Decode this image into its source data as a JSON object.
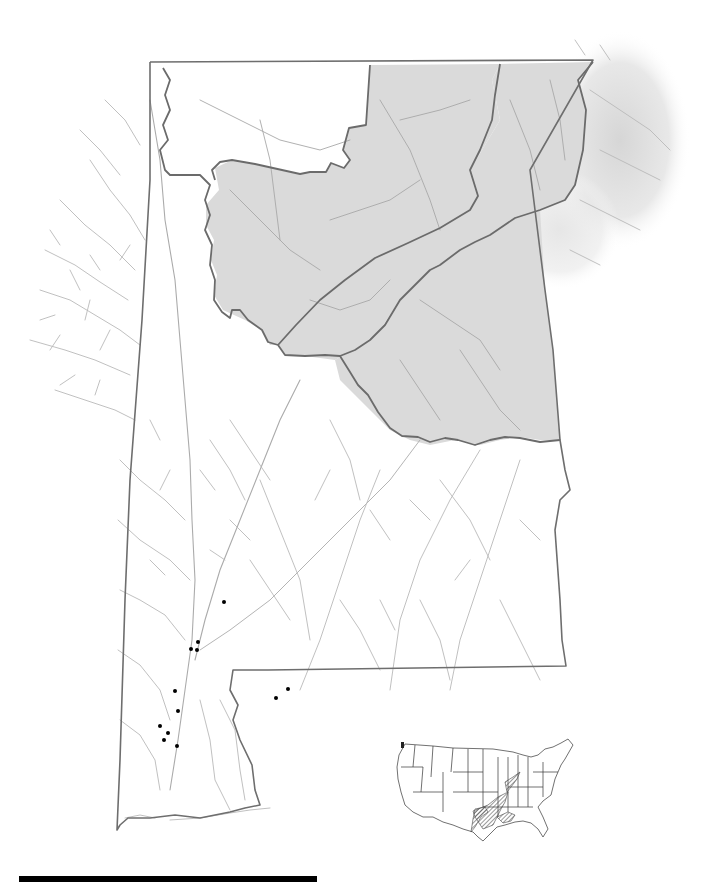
{
  "map": {
    "title": "",
    "region": "Alabama",
    "background_color": "#ffffff",
    "colors": {
      "state_border": "#6e6e6e",
      "region_border": "#666666",
      "shaded_region_fill": "#d9d9d9",
      "river": "#b8b8b8",
      "river_shaded": "#a8a8a8",
      "occurrence_dot": "#000000",
      "inset_outline": "#333333",
      "inset_range_hatch": "#555555",
      "scale_bar": "#000000"
    },
    "shaded_regions": [
      {
        "name": "northwest-plateau-region"
      },
      {
        "name": "northeast-valley-ridge-region"
      },
      {
        "name": "central-ridge-region"
      },
      {
        "name": "piedmont-region"
      }
    ],
    "occurrence_points": [
      {
        "x": 224,
        "y": 602
      },
      {
        "x": 198,
        "y": 642
      },
      {
        "x": 191,
        "y": 649
      },
      {
        "x": 197,
        "y": 650
      },
      {
        "x": 175,
        "y": 691
      },
      {
        "x": 178,
        "y": 711
      },
      {
        "x": 160,
        "y": 726
      },
      {
        "x": 168,
        "y": 733
      },
      {
        "x": 164,
        "y": 740
      },
      {
        "x": 177,
        "y": 746
      },
      {
        "x": 288,
        "y": 689
      },
      {
        "x": 276,
        "y": 698
      }
    ],
    "inset": {
      "name": "united-states-inset-map",
      "highlighted_range": "Gulf coastal plain and Mississippi/Tennessee river drainages (hatched)"
    },
    "scale_bar": {
      "label": "",
      "length_px": 298
    }
  }
}
